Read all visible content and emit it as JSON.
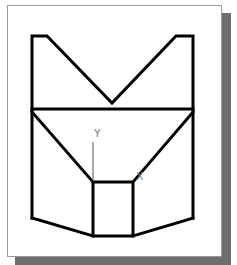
{
  "viewport": {
    "background": "#ffffff",
    "panel_border": "#9a9a9a",
    "shadow": "#6e6e6e"
  },
  "drawing": {
    "stroke": "#000000",
    "stroke_width": 3,
    "outline_polyline": "32,218 32,36 47,36 112,103 176,36 193,36 193,218",
    "mid_line": "32,109 193,109",
    "left_diagonal": "32,112 93,182",
    "right_diagonal": "193,112 133,182",
    "center_box": {
      "x": 93,
      "y": 182,
      "width": 40,
      "height": 54
    },
    "bottom_left": "32,218 93,236",
    "bottom_right": "193,218 133,236"
  },
  "ucs_icon": {
    "color": "#7a7a7a",
    "y_axis_line": "93,142 93,182",
    "y_label": "Y",
    "x_label": "X"
  }
}
